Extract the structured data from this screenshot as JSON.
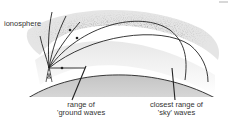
{
  "diagram": {
    "labels": {
      "ionosphere": "ionosphere",
      "ground_range_line1": "range of",
      "ground_range_line2": "'ground waves",
      "sky_range_line1": "closest range of",
      "sky_range_line2": "'sky' waves"
    },
    "elements": [
      "ionosphere-band",
      "earth-surface",
      "transmitter-tower",
      "escaping-rays",
      "reflected-sky-waves",
      "ground-wave",
      "pointer-ground-range",
      "pointer-sky-range"
    ],
    "colors": {
      "line": "#222222",
      "ionosphere": "#9a9a9a",
      "earth": "#cfcfcf",
      "text": "#333333"
    }
  }
}
